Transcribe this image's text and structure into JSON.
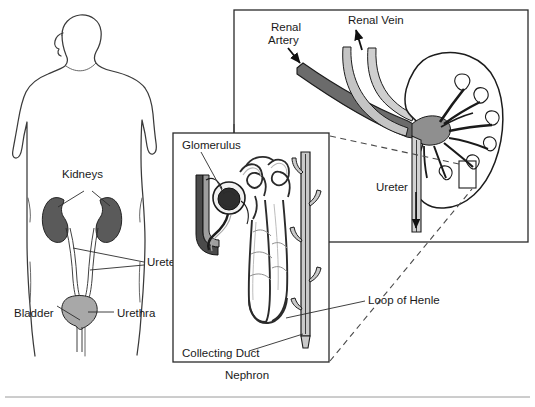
{
  "figure": {
    "background_color": "#ffffff",
    "width": 535,
    "height": 407
  },
  "colors": {
    "outline": "#2b2b2b",
    "artery_gray": "#6b6b6b",
    "vein_light": "#b8b8b8",
    "kidney_fill": "#5a5a5a",
    "bladder_fill": "#a8a8a8",
    "glomerulus_dark": "#2e2e2e",
    "tubule_light": "#c9c9c9",
    "duct_gray": "#9d9d9d",
    "dashed_line": "#4a4a4a",
    "rule_line": "#9a9a9a",
    "text": "#1a1a1a",
    "panel_border": "#2a2a2a"
  },
  "body_panel": {
    "name": "human-torso-urinary-system",
    "labels": {
      "kidneys": "Kidneys",
      "ureters": "Ureters",
      "bladder": "Bladder",
      "urethra": "Urethra"
    }
  },
  "kidney_panel": {
    "name": "kidney-cross-section",
    "labels": {
      "renal_artery_line1": "Renal",
      "renal_artery_line2": "Artery",
      "renal_vein": "Renal Vein",
      "ureter": "Ureter"
    },
    "callout_box": "nephron-magnification-region"
  },
  "nephron_panel": {
    "name": "nephron-detail",
    "labels": {
      "glomerulus": "Glomerulus",
      "collecting_duct": "Collecting Duct",
      "caption": "Nephron",
      "loop_of_henle": "Loop of Henle"
    }
  }
}
